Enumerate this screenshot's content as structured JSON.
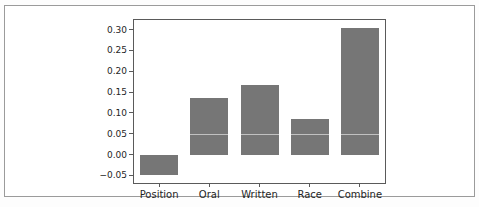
{
  "chart_data": {
    "type": "bar",
    "title": "",
    "xlabel": "",
    "ylabel": "",
    "categories": [
      "Position",
      "Oral",
      "Written",
      "Race",
      "Combine"
    ],
    "values": [
      -0.05,
      0.135,
      0.168,
      0.085,
      0.305
    ],
    "yticks": [
      -0.05,
      0.0,
      0.05,
      0.1,
      0.15,
      0.2,
      0.25,
      0.3
    ],
    "ytick_labels": [
      "−0.05",
      "0.00",
      "0.05",
      "0.10",
      "0.15",
      "0.20",
      "0.25",
      "0.30"
    ],
    "ylim": [
      -0.068,
      0.323
    ],
    "grid": false,
    "legend": null,
    "bar_color": "#767676",
    "spine_color": "#5a5a5a",
    "frame_border_color": "#9b9b9b",
    "reference_line": {
      "y": 0.05,
      "color": "#ffffff",
      "note": "faint light horizontal line visible across the bars at the 0.05 level"
    }
  }
}
